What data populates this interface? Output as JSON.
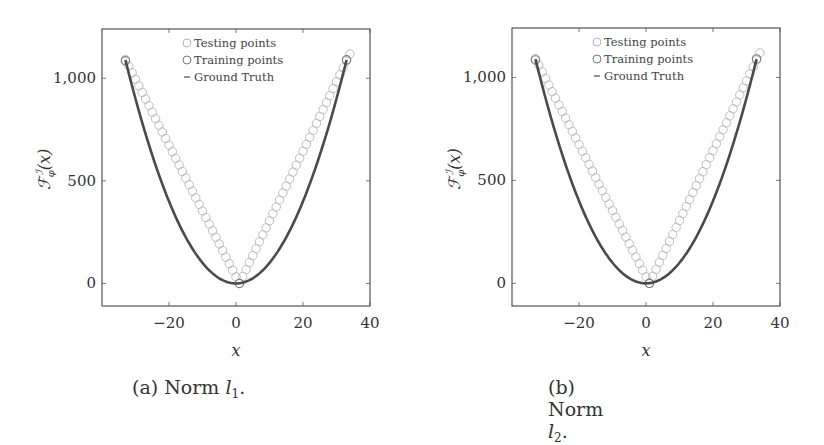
{
  "chart_data": [
    {
      "type": "scatter",
      "panel": "a",
      "caption_prefix": "(a) Norm ",
      "caption_var": "l",
      "caption_sub": "1",
      "caption_suffix": ".",
      "xlabel": "x",
      "ylabel": "F_φ^I(x)",
      "xlim": [
        -40,
        40
      ],
      "ylim": [
        -110,
        1240
      ],
      "xticks": [
        -20,
        0,
        20,
        40
      ],
      "xtick_labels": [
        "−20",
        "0",
        "20",
        "40"
      ],
      "yticks": [
        0,
        500,
        1000
      ],
      "ytick_labels": [
        "0",
        "500",
        "1,000"
      ],
      "grid": false,
      "legend_position": "top-center",
      "legend": [
        "Testing points",
        "Training points",
        "Ground Truth"
      ],
      "series": [
        {
          "name": "Testing points",
          "kind": "markers",
          "color": "#b5b5b5",
          "model": "v-shape",
          "x_range": [
            -33,
            34
          ],
          "vertex_x": 1,
          "slope_left": 32.1,
          "slope_right": 33.9
        },
        {
          "name": "Training points",
          "kind": "markers",
          "color": "#7a7a7a",
          "x": [
            -33,
            1,
            33
          ],
          "y": [
            1085,
            0,
            1090
          ]
        },
        {
          "name": "Ground Truth",
          "kind": "line",
          "color": "#4a4a4a",
          "formula": "x^2",
          "x_range": [
            -33,
            33
          ]
        }
      ]
    },
    {
      "type": "scatter",
      "panel": "b",
      "caption_prefix": "(b) Norm ",
      "caption_var": "l",
      "caption_sub": "2",
      "caption_suffix": ".",
      "xlabel": "x",
      "ylabel": "F_φ^I(x)",
      "xlim": [
        -40,
        40
      ],
      "ylim": [
        -110,
        1240
      ],
      "xticks": [
        -20,
        0,
        20,
        40
      ],
      "xtick_labels": [
        "−20",
        "0",
        "20",
        "40"
      ],
      "yticks": [
        0,
        500,
        1000
      ],
      "ytick_labels": [
        "0",
        "500",
        "1,000"
      ],
      "grid": false,
      "legend_position": "top-center",
      "legend": [
        "Testing points",
        "Training points",
        "Ground Truth"
      ],
      "series": [
        {
          "name": "Testing points",
          "kind": "markers",
          "color": "#b5b5b5",
          "model": "v-shape",
          "x_range": [
            -33,
            34
          ],
          "vertex_x": 1,
          "slope_left": 32.1,
          "slope_right": 33.9
        },
        {
          "name": "Training points",
          "kind": "markers",
          "color": "#7a7a7a",
          "x": [
            -33,
            1,
            33
          ],
          "y": [
            1085,
            0,
            1090
          ]
        },
        {
          "name": "Ground Truth",
          "kind": "line",
          "color": "#4a4a4a",
          "formula": "x^2",
          "x_range": [
            -33,
            33
          ]
        }
      ]
    }
  ]
}
